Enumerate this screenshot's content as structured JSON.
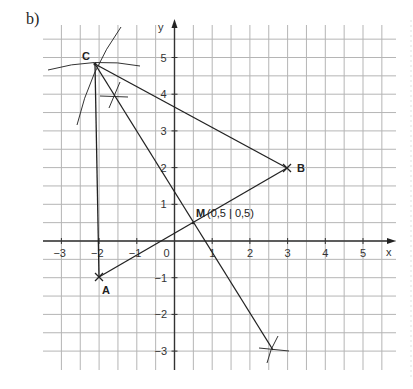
{
  "figure": {
    "part_label": "b)",
    "x_axis_label": "x",
    "y_axis_label": "y",
    "x_ticks": [
      {
        "value": -3,
        "label": "−3"
      },
      {
        "value": -2,
        "label": "−2"
      },
      {
        "value": -1,
        "label": "−1"
      },
      {
        "value": 0,
        "label": "0"
      },
      {
        "value": 1,
        "label": "1"
      },
      {
        "value": 2,
        "label": "2"
      },
      {
        "value": 3,
        "label": "3"
      },
      {
        "value": 4,
        "label": "4"
      },
      {
        "value": 5,
        "label": "5"
      }
    ],
    "y_ticks": [
      {
        "value": 5,
        "label": "5"
      },
      {
        "value": 4,
        "label": "4"
      },
      {
        "value": 3,
        "label": "3"
      },
      {
        "value": 2,
        "label": "2"
      },
      {
        "value": 1,
        "label": "1"
      },
      {
        "value": -1,
        "label": "−1"
      },
      {
        "value": -2,
        "label": "−2"
      },
      {
        "value": -3,
        "label": "−3"
      }
    ],
    "points": {
      "A": {
        "label": "A",
        "x": -2,
        "y": -1
      },
      "B": {
        "label": "B",
        "x": 3,
        "y": 2
      },
      "C": {
        "label": "C",
        "x": -2,
        "y": 4.8
      },
      "M": {
        "label": "M",
        "coords_label": "(0,5 | 0,5)",
        "x": 0.5,
        "y": 0.5
      }
    },
    "segments": [
      {
        "from": "A",
        "to": "B",
        "name": "side-ab"
      },
      {
        "from": "B",
        "to": "C",
        "name": "side-bc"
      },
      {
        "from": "C",
        "to": "A",
        "name": "side-ca"
      },
      {
        "from": "C",
        "to": "bisector-end",
        "name": "perpendicular-bisector-line"
      }
    ],
    "colors": {
      "grid": "#b5b5b5",
      "lines": "#222222",
      "background": "#ffffff"
    }
  }
}
